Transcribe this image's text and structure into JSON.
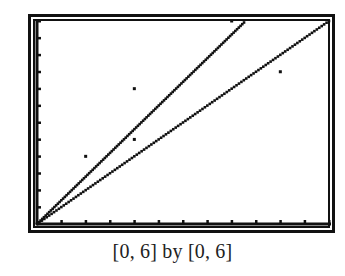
{
  "chart_data": {
    "type": "scatter",
    "title": "",
    "caption": "[0, 6] by [0, 6]",
    "xlabel": "",
    "ylabel": "",
    "xlim": [
      0,
      6
    ],
    "ylim": [
      0,
      6
    ],
    "xscl": 0.5,
    "yscl": 0.5,
    "grid": false,
    "legend": null,
    "series": [
      {
        "name": "data points",
        "type": "scatter",
        "points": [
          {
            "x": 1,
            "y": 2
          },
          {
            "x": 2,
            "y": 2.5
          },
          {
            "x": 2,
            "y": 4
          },
          {
            "x": 4,
            "y": 6
          },
          {
            "x": 5,
            "y": 4.5
          }
        ]
      },
      {
        "name": "steep line",
        "type": "line",
        "slope": 1.4,
        "intercept": 0,
        "x_range": [
          0,
          4.29
        ]
      },
      {
        "name": "y = x line",
        "type": "line",
        "slope": 1.0,
        "intercept": 0,
        "x_range": [
          0,
          6
        ]
      }
    ]
  },
  "window": {
    "caption": "[0, 6] by [0, 6]"
  },
  "colors": {
    "ink": "#111111",
    "background": "#ffffff"
  }
}
